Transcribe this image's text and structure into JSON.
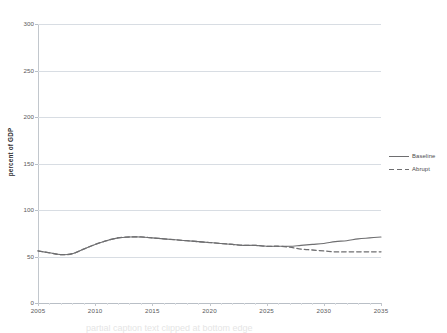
{
  "chart_data": {
    "type": "line",
    "title": "",
    "xlabel": "",
    "ylabel": "percent of GDP",
    "xlim": [
      2005,
      2035
    ],
    "ylim": [
      0,
      300
    ],
    "grid": true,
    "legend_position": "right",
    "y_ticks": [
      0,
      50,
      100,
      150,
      200,
      250,
      300
    ],
    "y_tick_labels": [
      "0",
      "50",
      "100",
      "150",
      "200",
      "250",
      "300"
    ],
    "x_ticks": [
      2005,
      2010,
      2015,
      2020,
      2025,
      2030,
      2035
    ],
    "x_tick_labels": [
      "2005",
      "2010",
      "2015",
      "2020",
      "2025",
      "2030",
      "2035"
    ],
    "x": [
      2005,
      2006,
      2007,
      2008,
      2009,
      2010,
      2011,
      2012,
      2013,
      2014,
      2015,
      2016,
      2017,
      2018,
      2019,
      2020,
      2021,
      2022,
      2023,
      2024,
      2025,
      2026,
      2027,
      2028,
      2029,
      2030,
      2031,
      2032,
      2033,
      2034,
      2035
    ],
    "series": [
      {
        "name": "Baseline",
        "style": "solid",
        "color": "#6e6e70",
        "values": [
          56,
          54,
          52,
          53,
          58,
          63,
          67,
          70,
          71,
          71,
          70,
          69,
          68,
          67,
          66,
          65,
          64,
          63,
          62,
          62,
          61,
          61,
          61,
          62,
          63,
          64,
          66,
          67,
          69,
          70,
          71
        ]
      },
      {
        "name": "Abrupt",
        "style": "dashed",
        "color": "#6e6e70",
        "values": [
          56,
          54,
          52,
          53,
          58,
          63,
          67,
          70,
          71,
          71,
          70,
          69,
          68,
          67,
          66,
          65,
          64,
          63,
          62,
          62,
          61,
          61,
          60,
          58,
          57,
          56,
          55,
          55,
          55,
          55,
          55
        ]
      }
    ]
  },
  "legend": {
    "items": [
      {
        "label": "Baseline",
        "style": "solid"
      },
      {
        "label": "Abrupt",
        "style": "dashed"
      }
    ]
  },
  "axis": {
    "y_title": "percent of GDP"
  },
  "caption": {
    "clipped_text": "partial caption text clipped at bottom edge"
  },
  "colors": {
    "series_line": "#6e6e70",
    "gridline": "#d8dde3",
    "axis": "#c2c7cd",
    "tick_text": "#59595b",
    "background": "#ffffff"
  }
}
